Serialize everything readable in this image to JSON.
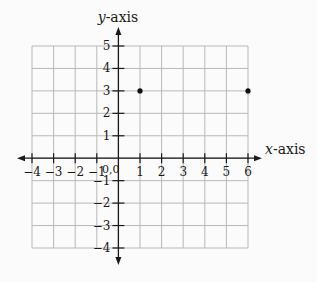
{
  "colors": {
    "background": "#fbfbfb",
    "grid": "#b8b8b8",
    "axis": "#1a1a1a",
    "point": "#111111"
  },
  "chart_data": {
    "type": "scatter",
    "title": "",
    "xlabel": "x-axis",
    "ylabel": "y-axis",
    "xlabel_var": "x",
    "ylabel_var": "y",
    "xlabel_suffix": "-axis",
    "ylabel_suffix": "-axis",
    "xlim": [
      -4,
      6
    ],
    "ylim": [
      -4,
      5
    ],
    "grid": true,
    "origin_label": "0,0",
    "x_ticks": [
      -4,
      -3,
      -2,
      -1,
      1,
      2,
      3,
      4,
      5,
      6
    ],
    "x_tick_labels": [
      "−4",
      "−3",
      "−2",
      "−1",
      "1",
      "2",
      "3",
      "4",
      "5",
      "6"
    ],
    "y_ticks": [
      5,
      4,
      3,
      2,
      1,
      -1,
      -2,
      -3,
      -4
    ],
    "y_tick_labels": [
      "5",
      "4",
      "3",
      "2",
      "1",
      "−1",
      "−2",
      "−3",
      "−4"
    ],
    "points": [
      {
        "x": 1,
        "y": 3
      },
      {
        "x": 6,
        "y": 3
      }
    ]
  }
}
